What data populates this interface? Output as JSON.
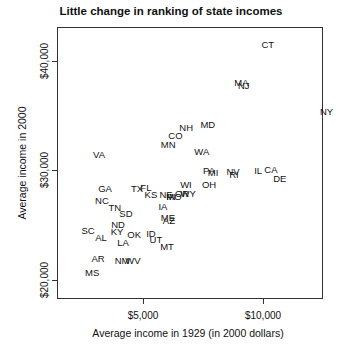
{
  "chart_data": {
    "type": "scatter",
    "title": "Little change in ranking of state incomes",
    "xlabel": "Average income in 1929 (in 2000 dollars)",
    "ylabel": "Average income in 2000",
    "xticks": [
      {
        "value": 5000,
        "label": "$5,000"
      },
      {
        "value": 10000,
        "label": "$10,000"
      }
    ],
    "yticks": [
      {
        "value": 20000,
        "label": "$20,000"
      },
      {
        "value": 30000,
        "label": "$30,000"
      },
      {
        "value": 40000,
        "label": "$40,000"
      }
    ],
    "xlim": [
      1400,
      12500
    ],
    "ylim": [
      18800,
      43700
    ],
    "grid": false,
    "legend": null,
    "points": [
      {
        "label": "CT",
        "x": 10200,
        "y": 41400
      },
      {
        "label": "MA",
        "x": 9100,
        "y": 37900
      },
      {
        "label": "NJ",
        "x": 9200,
        "y": 37700
      },
      {
        "label": "NY",
        "x": 12650,
        "y": 35300
      },
      {
        "label": "MD",
        "x": 7700,
        "y": 34100
      },
      {
        "label": "NH",
        "x": 6800,
        "y": 33800
      },
      {
        "label": "CO",
        "x": 6350,
        "y": 33100
      },
      {
        "label": "MN",
        "x": 6050,
        "y": 32300
      },
      {
        "label": "WA",
        "x": 7450,
        "y": 31600
      },
      {
        "label": "VA",
        "x": 3170,
        "y": 31400
      },
      {
        "label": "IL",
        "x": 9800,
        "y": 29900
      },
      {
        "label": "CA",
        "x": 10330,
        "y": 30000
      },
      {
        "label": "DE",
        "x": 10700,
        "y": 29200
      },
      {
        "label": "PA",
        "x": 7750,
        "y": 29900
      },
      {
        "label": "MI",
        "x": 7920,
        "y": 29700
      },
      {
        "label": "NV",
        "x": 8750,
        "y": 29800
      },
      {
        "label": "RI",
        "x": 8790,
        "y": 29500
      },
      {
        "label": "GA",
        "x": 3420,
        "y": 28300
      },
      {
        "label": "TX",
        "x": 4750,
        "y": 28300
      },
      {
        "label": "FL",
        "x": 5120,
        "y": 28400
      },
      {
        "label": "KS",
        "x": 5330,
        "y": 27700
      },
      {
        "label": "NE",
        "x": 5960,
        "y": 27700
      },
      {
        "label": "IN",
        "x": 6170,
        "y": 27500
      },
      {
        "label": "MO",
        "x": 6290,
        "y": 27500
      },
      {
        "label": "OR",
        "x": 6630,
        "y": 27800
      },
      {
        "label": "WY",
        "x": 6880,
        "y": 27800
      },
      {
        "label": "WI",
        "x": 6790,
        "y": 28600
      },
      {
        "label": "OH",
        "x": 7750,
        "y": 28600
      },
      {
        "label": "NC",
        "x": 3290,
        "y": 27200
      },
      {
        "label": "TN",
        "x": 3830,
        "y": 26500
      },
      {
        "label": "SD",
        "x": 4290,
        "y": 26000
      },
      {
        "label": "IA",
        "x": 5830,
        "y": 26600
      },
      {
        "label": "ME",
        "x": 6040,
        "y": 25600
      },
      {
        "label": "AZ",
        "x": 6080,
        "y": 25300
      },
      {
        "label": "ND",
        "x": 3960,
        "y": 25000
      },
      {
        "label": "SC",
        "x": 2710,
        "y": 24400
      },
      {
        "label": "AL",
        "x": 3250,
        "y": 23800
      },
      {
        "label": "KY",
        "x": 3920,
        "y": 24300
      },
      {
        "label": "OK",
        "x": 4630,
        "y": 24100
      },
      {
        "label": "ID",
        "x": 5330,
        "y": 24200
      },
      {
        "label": "LA",
        "x": 4170,
        "y": 23300
      },
      {
        "label": "UT",
        "x": 5540,
        "y": 23600
      },
      {
        "label": "MT",
        "x": 6000,
        "y": 23000
      },
      {
        "label": "AR",
        "x": 3130,
        "y": 21900
      },
      {
        "label": "NM",
        "x": 4130,
        "y": 21700
      },
      {
        "label": "WV",
        "x": 4580,
        "y": 21700
      },
      {
        "label": "MS",
        "x": 2880,
        "y": 20600
      }
    ]
  }
}
